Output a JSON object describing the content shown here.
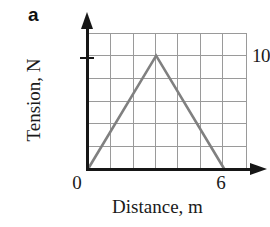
{
  "figure": {
    "panel_letter": "a",
    "background_color": "#ffffff",
    "axis_color": "#161616",
    "grid_color": "#9a9a9a",
    "series_color": "#808080"
  },
  "chart_data": {
    "type": "line",
    "title": "",
    "subtitle": "",
    "panel_label": "a",
    "xlabel": "Distance, m",
    "ylabel": "Tension, N",
    "x": [
      0,
      3,
      6
    ],
    "y": [
      0,
      10,
      0
    ],
    "series": [
      {
        "name": "Tension vs Distance",
        "x": [
          0,
          3,
          6
        ],
        "values": [
          0,
          10,
          0
        ],
        "color": "#808080"
      }
    ],
    "xlim": [
      0,
      7
    ],
    "ylim": [
      0,
      12
    ],
    "xticks": [
      0,
      6
    ],
    "xtick_labels": [
      "0",
      "6"
    ],
    "yticks": [
      10
    ],
    "ytick_labels": [
      "10"
    ],
    "grid": true,
    "grid_columns": 7,
    "grid_rows": 6,
    "grid_x_step": 1,
    "grid_y_step": 2,
    "legend": null,
    "annotations": []
  },
  "axes": {
    "y_tick_label": "10",
    "x_tick_label_left": "0",
    "x_tick_label_right": "6",
    "y_axis_title": "Tension, N",
    "x_axis_title": "Distance, m"
  }
}
